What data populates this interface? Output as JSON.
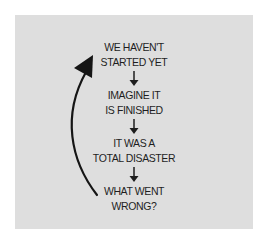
{
  "diagram": {
    "type": "cyclic-flow",
    "background_color": "#dedede",
    "text_color": "#1e1e1e",
    "steps": [
      {
        "lines": [
          "WE HAVEN'T",
          "STARTED YET"
        ]
      },
      {
        "lines": [
          "IMAGINE IT",
          "IS FINISHED"
        ]
      },
      {
        "lines": [
          "IT WAS A",
          "TOTAL DISASTER"
        ]
      },
      {
        "lines": [
          "WHAT WENT",
          "WRONG?"
        ]
      }
    ],
    "connectors": [
      "down-arrow",
      "down-arrow",
      "down-arrow"
    ],
    "loop_arrow": {
      "from": "WHAT WENT WRONG?",
      "to": "WE HAVEN'T STARTED YET",
      "icon": "curved-up-arrow"
    }
  }
}
